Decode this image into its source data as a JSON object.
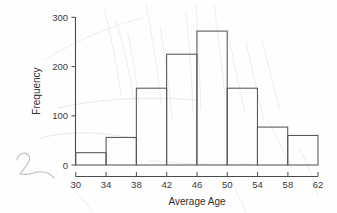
{
  "chart_data": {
    "type": "bar",
    "title": "",
    "subtitle": "",
    "xlabel": "Average Age",
    "ylabel": "Frequency",
    "categories": [
      "30-34",
      "34-38",
      "38-42",
      "42-46",
      "46-50",
      "50-54",
      "54-58",
      "58-62"
    ],
    "bin_edges": [
      30,
      34,
      38,
      42,
      46,
      50,
      54,
      58,
      62
    ],
    "values": [
      25,
      56,
      156,
      225,
      272,
      156,
      77,
      60
    ],
    "bin_width": 4,
    "xlim": [
      30,
      62
    ],
    "ylim": [
      0,
      300
    ],
    "xticks": [
      30,
      34,
      38,
      42,
      46,
      50,
      54,
      58,
      62
    ],
    "yticks": [
      0,
      100,
      200,
      300
    ],
    "xtick_labels": [
      "30",
      "34",
      "38",
      "42",
      "46",
      "50",
      "54",
      "58",
      "62"
    ],
    "ytick_labels": [
      "0",
      "100",
      "200",
      "300"
    ],
    "grid": false,
    "legend": null,
    "legend_position": "none",
    "annotations": []
  },
  "axes": {
    "y_title": "Frequency",
    "x_title": "Average Age",
    "y_ticks": [
      {
        "value": 300,
        "label": "300"
      },
      {
        "value": 200,
        "label": "200"
      },
      {
        "value": 100,
        "label": "100"
      },
      {
        "value": 0,
        "label": "0"
      }
    ],
    "x_ticks": [
      {
        "value": 30,
        "label": "30"
      },
      {
        "value": 34,
        "label": "34"
      },
      {
        "value": 38,
        "label": "38"
      },
      {
        "value": 42,
        "label": "42"
      },
      {
        "value": 46,
        "label": "46"
      },
      {
        "value": 50,
        "label": "50"
      },
      {
        "value": 54,
        "label": "54"
      },
      {
        "value": 58,
        "label": "58"
      },
      {
        "value": 62,
        "label": "62"
      }
    ]
  },
  "marks": {
    "handwritten_scribble": "2"
  },
  "colors": {
    "background": "#fefefe",
    "axis": "#4a4a4a",
    "bar_stroke": "#555555",
    "bar_fill": "#ffffff",
    "text": "#2e2e2e",
    "scribble": "#bdbdbd"
  }
}
